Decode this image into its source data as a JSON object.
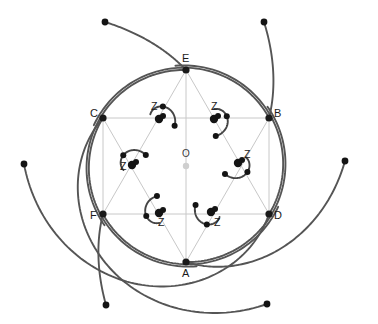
{
  "figure": {
    "type": "geometric-diagram",
    "canvas": {
      "width": 378,
      "height": 324,
      "background": "#ffffff"
    },
    "colors": {
      "spiral_stroke": "#555555",
      "hook_stroke": "#444444",
      "chord_stroke": "#c8c8c8",
      "vertex_fill": "#1a1a1a",
      "center_fill": "#cfcfcf",
      "label_fill": "#1a1a1a"
    },
    "center": {
      "label": "O",
      "x": 186,
      "y": 166,
      "label_x": 182,
      "label_y": 157
    },
    "hexagon": {
      "circumradius": 96,
      "vertices": [
        {
          "label": "A",
          "x": 186,
          "y": 262,
          "label_x": 182,
          "label_y": 277,
          "angle_deg": 90
        },
        {
          "label": "B",
          "x": 269,
          "y": 118,
          "label_x": 274,
          "label_y": 117,
          "angle_deg": -30
        },
        {
          "label": "C",
          "x": 103,
          "y": 118,
          "label_x": 90,
          "label_y": 117,
          "angle_deg": 210
        },
        {
          "label": "D",
          "x": 269,
          "y": 214,
          "label_x": 274,
          "label_y": 219,
          "angle_deg": 30
        },
        {
          "label": "E",
          "x": 186,
          "y": 70,
          "label_x": 182,
          "label_y": 62,
          "angle_deg": -90
        },
        {
          "label": "F",
          "x": 103,
          "y": 214,
          "label_x": 90,
          "label_y": 219,
          "angle_deg": 150
        }
      ],
      "chords": [
        [
          "C",
          "B"
        ],
        [
          "F",
          "D"
        ],
        [
          "E",
          "D"
        ],
        [
          "E",
          "F"
        ],
        [
          "A",
          "B"
        ],
        [
          "A",
          "C"
        ],
        [
          "C",
          "F"
        ],
        [
          "B",
          "D"
        ],
        [
          "E",
          "A"
        ]
      ]
    },
    "hooks": [
      {
        "label": "Z",
        "label_x": 151,
        "label_y": 110,
        "node_x": 159,
        "node_y": 119
      },
      {
        "label": "Z",
        "label_x": 211,
        "label_y": 110,
        "node_x": 214,
        "node_y": 119
      },
      {
        "label": "Z",
        "label_x": 120,
        "label_y": 170,
        "node_x": 132,
        "node_y": 165
      },
      {
        "label": "Z",
        "label_x": 244,
        "label_y": 158,
        "node_x": 238,
        "node_y": 163
      },
      {
        "label": "Z",
        "label_x": 158,
        "label_y": 226,
        "node_x": 159,
        "node_y": 213
      },
      {
        "label": "Z",
        "label_x": 214,
        "label_y": 226,
        "node_x": 211,
        "node_y": 212
      }
    ],
    "spiral_endpoints": [
      {
        "x": 105,
        "y": 22
      },
      {
        "x": 264,
        "y": 22
      },
      {
        "x": 24,
        "y": 164
      },
      {
        "x": 345,
        "y": 161
      },
      {
        "x": 106,
        "y": 305
      },
      {
        "x": 267,
        "y": 304
      }
    ],
    "counts": {
      "vertices": 6,
      "hooks": 6,
      "spiral_arcs": 6,
      "endpoints": 6
    }
  }
}
